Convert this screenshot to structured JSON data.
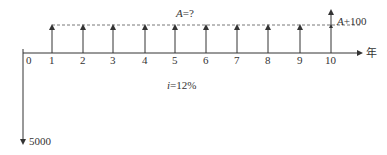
{
  "diagram": {
    "type": "cash-flow-diagram",
    "axis_unit_label": "年",
    "periods": [
      "0",
      "1",
      "2",
      "3",
      "4",
      "5",
      "6",
      "7",
      "8",
      "9",
      "10"
    ],
    "annuity_label": "A=?",
    "annuity_label_parts": {
      "var": "A",
      "rest": "=?"
    },
    "final_label_parts": {
      "var": "A",
      "rest": "+100"
    },
    "final_label": "A+100",
    "interest_label": "i=12%",
    "interest_label_parts": {
      "var": "i",
      "rest": "=12%"
    },
    "initial_outflow": "5000",
    "colors": {
      "line": "#333333",
      "dashed": "#555555"
    }
  }
}
